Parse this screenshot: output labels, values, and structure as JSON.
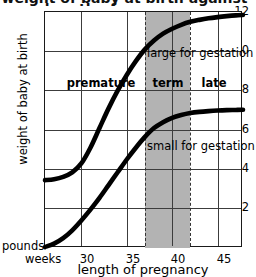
{
  "chart_data": {
    "type": "line",
    "title": "weight of baby at birth against length of pregnancy",
    "xlabel": "length of pregnancy",
    "ylabel": "weight of baby at birth",
    "x_unit_label": "weeks",
    "y_unit_label": "pounds",
    "xlim": [
      26,
      47.8
    ],
    "ylim": [
      0,
      12
    ],
    "xticks": [
      30,
      35,
      40,
      45
    ],
    "xtick_labels": [
      "30",
      "35",
      "40",
      "45"
    ],
    "yticks": [
      2,
      4,
      6,
      8,
      10,
      12
    ],
    "ytick_labels": [
      "2",
      "4",
      "6",
      "8",
      "10",
      "12"
    ],
    "grid": true,
    "legend": "none",
    "shaded_band": {
      "label": "term",
      "x_start": 37,
      "x_end": 42,
      "color": "#b3b3b3",
      "border_style": "dashed"
    },
    "zone_labels": [
      {
        "text": "premature",
        "x": 32.0,
        "y": 9.1
      },
      {
        "text": "term",
        "x": 39.5,
        "y": 9.1
      },
      {
        "text": "late",
        "x": 44.0,
        "y": 9.1
      }
    ],
    "annotations": [
      {
        "text": "large for gestation",
        "x": 42.2,
        "y": 10.2
      },
      {
        "text": "small for gestation",
        "x": 42.2,
        "y": 5.6
      }
    ],
    "series": [
      {
        "name": "large for gestation",
        "color": "#000000",
        "x": [
          26.0,
          27.0,
          28.0,
          29.0,
          30.0,
          31.0,
          32.0,
          33.0,
          34.0,
          35.0,
          36.0,
          37.0,
          38.0,
          39.0,
          40.0,
          41.0,
          42.0,
          43.0,
          44.0,
          45.0,
          46.0,
          47.0,
          47.8
        ],
        "y": [
          3.45,
          3.5,
          3.62,
          3.85,
          4.3,
          5.1,
          6.1,
          7.1,
          8.0,
          8.8,
          9.5,
          10.1,
          10.55,
          10.9,
          11.15,
          11.35,
          11.5,
          11.6,
          11.68,
          11.74,
          11.79,
          11.83,
          11.85
        ]
      },
      {
        "name": "small for gestation",
        "color": "#000000",
        "x": [
          26.0,
          27.0,
          28.0,
          29.0,
          30.0,
          31.0,
          32.0,
          33.0,
          34.0,
          35.0,
          36.0,
          37.0,
          38.0,
          39.0,
          40.0,
          41.0,
          42.0,
          43.0,
          44.0,
          45.0,
          46.0,
          47.0,
          47.8
        ],
        "y": [
          0.05,
          0.22,
          0.5,
          0.9,
          1.4,
          1.95,
          2.55,
          3.2,
          3.85,
          4.5,
          5.1,
          5.65,
          6.1,
          6.4,
          6.62,
          6.76,
          6.86,
          6.92,
          6.96,
          6.99,
          7.01,
          7.02,
          7.03
        ]
      }
    ]
  }
}
